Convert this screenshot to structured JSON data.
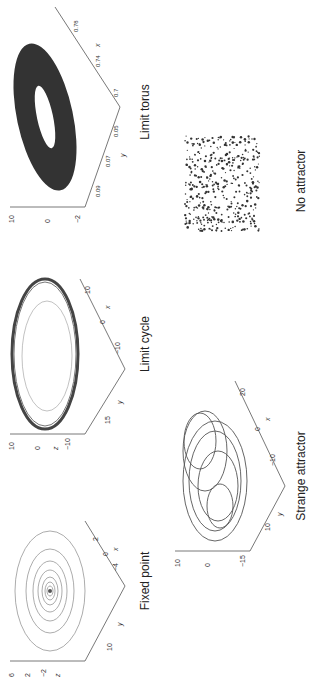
{
  "figure": {
    "orientation": "rotated-90-ccw",
    "panels": [
      {
        "id": "fixed-point",
        "caption": "Fixed point",
        "z_ticks": [
          "6",
          "4",
          "2",
          "0",
          "-2",
          "-4"
        ],
        "y_ticks": [
          "15",
          "10",
          "5",
          "0"
        ],
        "x_ticks": [
          "-6",
          "-4",
          "-2",
          "0",
          "2",
          "4"
        ],
        "axis_labels": {
          "x": "x",
          "y": "y",
          "z": "z"
        }
      },
      {
        "id": "limit-cycle",
        "caption": "Limit cycle",
        "z_ticks": [
          "10",
          "5",
          "0",
          "-5",
          "-10",
          "-15"
        ],
        "y_ticks": [
          "20",
          "15",
          "10",
          "5",
          "0"
        ],
        "x_ticks": [
          "-15",
          "-10",
          "-5",
          "0",
          "5",
          "10"
        ],
        "axis_labels": {
          "x": "x",
          "y": "y",
          "z": "z"
        }
      },
      {
        "id": "limit-torus",
        "caption": "Limit torus",
        "z_ticks": [
          "10",
          "0",
          "-2"
        ],
        "y_ticks": [
          "0.1",
          "0.09",
          "0.08",
          "0.07",
          "0.06",
          "0.05",
          "0.04",
          "0.03"
        ],
        "x_ticks": [
          "0.7",
          "0.72",
          "0.74",
          "0.76",
          "0.78"
        ],
        "axis_labels": {
          "x": "x",
          "y": "y",
          "z": "z"
        }
      },
      {
        "id": "strange-attractor",
        "caption": "Strange attractor",
        "z_ticks": [
          "10",
          "5",
          "0",
          "-5",
          "-10",
          "-15"
        ],
        "y_ticks": [
          "20",
          "10",
          "0",
          "-10"
        ],
        "x_ticks": [
          "-20",
          "-10",
          "0",
          "10",
          "20"
        ],
        "axis_labels": {
          "x": "x",
          "y": "y",
          "z": "z"
        }
      },
      {
        "id": "no-attractor",
        "caption": "No attractor"
      }
    ]
  }
}
